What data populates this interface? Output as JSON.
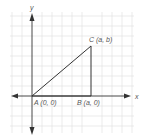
{
  "diagram": {
    "type": "coordinate-plane-triangle",
    "axes": {
      "x_label": "x",
      "y_label": "y"
    },
    "points": [
      {
        "id": "A",
        "label": "A (0, 0)"
      },
      {
        "id": "B",
        "label": "B (a, 0)"
      },
      {
        "id": "C",
        "label": "C (a, b)"
      }
    ],
    "colors": {
      "grid": "#e3e3e3",
      "axis": "#333333",
      "triangle": "#333333",
      "text": "#555555"
    }
  }
}
